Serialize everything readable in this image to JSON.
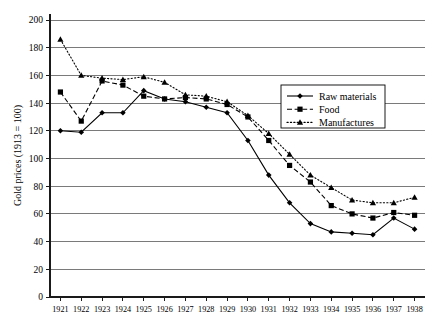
{
  "chart_data": {
    "type": "line",
    "title": "",
    "xlabel": "",
    "ylabel": "Gold prices (1913 = 100)",
    "x": [
      1921,
      1922,
      1923,
      1924,
      1925,
      1926,
      1927,
      1928,
      1929,
      1930,
      1931,
      1932,
      1933,
      1934,
      1935,
      1936,
      1937,
      1938
    ],
    "categories": [
      "1921",
      "1922",
      "1923",
      "1924",
      "1925",
      "1926",
      "1927",
      "1928",
      "1929",
      "1930",
      "1931",
      "1932",
      "1933",
      "1934",
      "1935",
      "1936",
      "1937",
      "1938"
    ],
    "xlim": [
      1920.5,
      1938.5
    ],
    "ylim": [
      0,
      200
    ],
    "yticks": [
      0,
      20,
      40,
      60,
      80,
      100,
      120,
      140,
      160,
      180,
      200
    ],
    "ytick_labels": [
      "0",
      "20",
      "40",
      "60",
      "80",
      "100",
      "120",
      "140",
      "160",
      "180",
      "200"
    ],
    "grid": "horizontal",
    "legend_position": "center-right",
    "series": [
      {
        "name": "Raw materials",
        "marker": "diamond",
        "line_style": "solid",
        "values": [
          120,
          119,
          133,
          133,
          149,
          143,
          141,
          137,
          133,
          113,
          88,
          68,
          53,
          47,
          46,
          45,
          57,
          49
        ]
      },
      {
        "name": "Food",
        "marker": "square",
        "line_style": "dashed",
        "values": [
          148,
          127,
          156,
          153,
          145,
          143,
          144,
          143,
          139,
          130,
          113,
          95,
          83,
          66,
          60,
          57,
          61,
          59
        ]
      },
      {
        "name": "Manufactures",
        "marker": "triangle",
        "line_style": "dotted",
        "values": [
          186,
          160,
          158,
          157,
          159,
          155,
          146,
          145,
          141,
          131,
          118,
          103,
          88,
          79,
          70,
          68,
          68,
          72
        ]
      }
    ]
  },
  "legend": {
    "items": [
      {
        "label": "Raw materials"
      },
      {
        "label": "Food"
      },
      {
        "label": "Manufactures"
      }
    ]
  },
  "colors": {
    "line": "#000000",
    "grid": "#7a7a7a",
    "axis": "#1a1a1a",
    "background": "#ffffff"
  }
}
